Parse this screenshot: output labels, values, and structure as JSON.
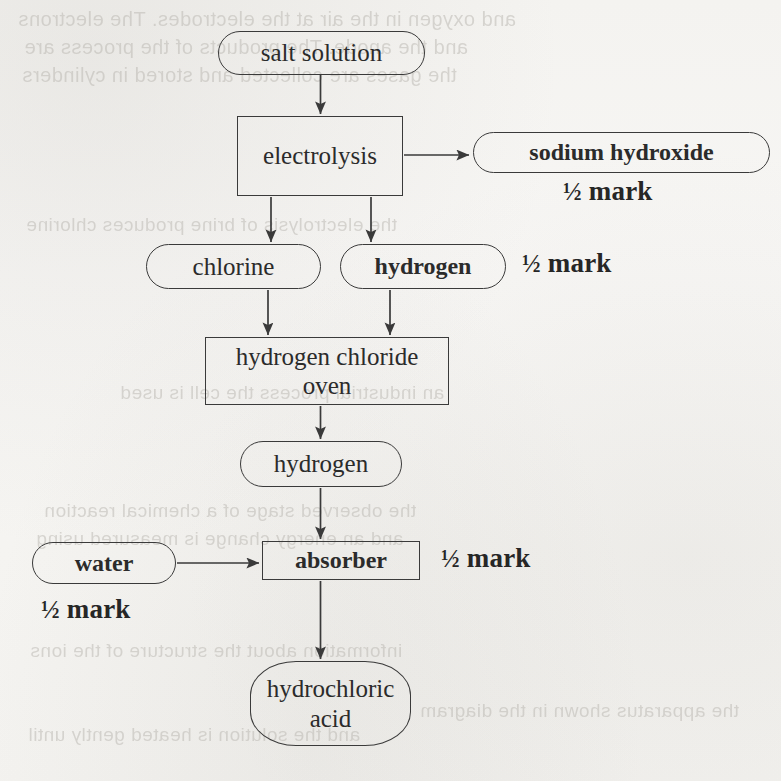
{
  "document": {
    "kind": "flowchart",
    "subject": "Industrial manufacture of hydrochloric acid from salt solution",
    "background_color": "#f6f5f3",
    "ink_color": "#2b2b2b"
  },
  "nodes": [
    {
      "id": "salt-solution",
      "label": "salt solution",
      "shape": "terminal",
      "bold": false,
      "x": 218,
      "y": 31,
      "w": 207,
      "h": 44,
      "font_size": 25
    },
    {
      "id": "electrolysis",
      "label": "electrolysis",
      "shape": "process",
      "bold": false,
      "x": 237,
      "y": 116,
      "w": 166,
      "h": 80,
      "font_size": 25
    },
    {
      "id": "sodium-hydroxide",
      "label": "sodium hydroxide",
      "shape": "terminal",
      "bold": true,
      "x": 473,
      "y": 132,
      "w": 297,
      "h": 41,
      "font_size": 24
    },
    {
      "id": "chlorine",
      "label": "chlorine",
      "shape": "terminal",
      "bold": false,
      "x": 146,
      "y": 244,
      "w": 175,
      "h": 45,
      "font_size": 25
    },
    {
      "id": "hydrogen-top",
      "label": "hydrogen",
      "shape": "terminal",
      "bold": true,
      "x": 340,
      "y": 244,
      "w": 166,
      "h": 45,
      "font_size": 24
    },
    {
      "id": "hydrogen-chloride-oven",
      "label": "hydrogen chloride\noven",
      "shape": "process",
      "bold": false,
      "x": 205,
      "y": 337,
      "w": 244,
      "h": 68,
      "font_size": 25
    },
    {
      "id": "hydrogen-bottom",
      "label": "hydrogen",
      "shape": "terminal",
      "bold": false,
      "x": 240,
      "y": 441,
      "w": 162,
      "h": 46,
      "font_size": 25
    },
    {
      "id": "water",
      "label": "water",
      "shape": "terminal",
      "bold": true,
      "x": 32,
      "y": 542,
      "w": 144,
      "h": 42,
      "font_size": 24
    },
    {
      "id": "absorber",
      "label": "absorber",
      "shape": "process",
      "bold": true,
      "x": 262,
      "y": 541,
      "w": 158,
      "h": 39,
      "font_size": 24
    },
    {
      "id": "hydrochloric-acid",
      "label": "hydrochloric\nacid",
      "shape": "terminal",
      "bold": false,
      "x": 250,
      "y": 661,
      "w": 161,
      "h": 85,
      "font_size": 25
    }
  ],
  "marks": [
    {
      "id": "mark-sodium-hydroxide",
      "fraction": "½",
      "text": "mark",
      "x": 563,
      "y": 176,
      "font_size": 27
    },
    {
      "id": "mark-hydrogen",
      "fraction": "½",
      "text": "mark",
      "x": 522,
      "y": 248,
      "font_size": 27
    },
    {
      "id": "mark-absorber",
      "fraction": "½",
      "text": "mark",
      "x": 441,
      "y": 543,
      "font_size": 27
    },
    {
      "id": "mark-water",
      "fraction": "½",
      "text": "mark",
      "x": 41,
      "y": 594,
      "font_size": 27
    }
  ],
  "connectors": [
    {
      "id": "salt-solution-to-electrolysis",
      "from": "salt-solution",
      "to": "electrolysis",
      "path": "M 320.5 75 L 320.5 114",
      "arrow": true
    },
    {
      "id": "electrolysis-to-sodium-hydroxide",
      "from": "electrolysis",
      "to": "sodium-hydroxide",
      "path": "M 404 155 L 469 155",
      "arrow": true
    },
    {
      "id": "electrolysis-to-chlorine",
      "from": "electrolysis",
      "to": "chlorine",
      "path": "M 271 197 L 271 242",
      "arrow": true
    },
    {
      "id": "electrolysis-to-hydrogen",
      "from": "electrolysis",
      "to": "hydrogen-top",
      "path": "M 371 197 L 371 242",
      "arrow": true
    },
    {
      "id": "chlorine-to-oven",
      "from": "chlorine",
      "to": "hydrogen-chloride-oven",
      "path": "M 268 290 L 268 335",
      "arrow": true
    },
    {
      "id": "hydrogen-to-oven",
      "from": "hydrogen-top",
      "to": "hydrogen-chloride-oven",
      "path": "M 390 290 L 390 335",
      "arrow": true
    },
    {
      "id": "oven-to-hydrogen",
      "from": "hydrogen-chloride-oven",
      "to": "hydrogen-bottom",
      "path": "M 320.5 406 L 320.5 439",
      "arrow": true
    },
    {
      "id": "hydrogen-to-absorber",
      "from": "hydrogen-bottom",
      "to": "absorber",
      "path": "M 320.5 488 L 320.5 539",
      "arrow": true
    },
    {
      "id": "water-to-absorber",
      "from": "water",
      "to": "absorber",
      "path": "M 177 563 L 259 563",
      "arrow": true
    },
    {
      "id": "absorber-to-hydrochloric-acid",
      "from": "absorber",
      "to": "hydrochloric-acid",
      "path": "M 320.5 581 L 320.5 659",
      "arrow": true
    }
  ],
  "ghost_text": [
    {
      "text": "and oxygen in the air at the electrodes. The electrons",
      "x": 18,
      "y": 8,
      "size": 20
    },
    {
      "text": "and the anode. The products of the process are",
      "x": 24,
      "y": 36,
      "size": 20
    },
    {
      "text": "the gases are collected and stored in cylinders",
      "x": 22,
      "y": 64,
      "size": 20
    },
    {
      "text": "the electrolysis of brine produces chlorine",
      "x": 26,
      "y": 214,
      "size": 19
    },
    {
      "text": "an industrial process the cell is used",
      "x": 120,
      "y": 382,
      "size": 19
    },
    {
      "text": "the observed stage of a chemical reaction",
      "x": 44,
      "y": 500,
      "size": 19
    },
    {
      "text": "and an energy change is measured using",
      "x": 36,
      "y": 528,
      "size": 19
    },
    {
      "text": "information about the structure of the ions",
      "x": 30,
      "y": 640,
      "size": 19
    },
    {
      "text": "and the solution is heated gently until",
      "x": 28,
      "y": 724,
      "size": 19
    },
    {
      "text": "the apparatus shown in the diagram",
      "x": 420,
      "y": 700,
      "size": 19
    }
  ]
}
